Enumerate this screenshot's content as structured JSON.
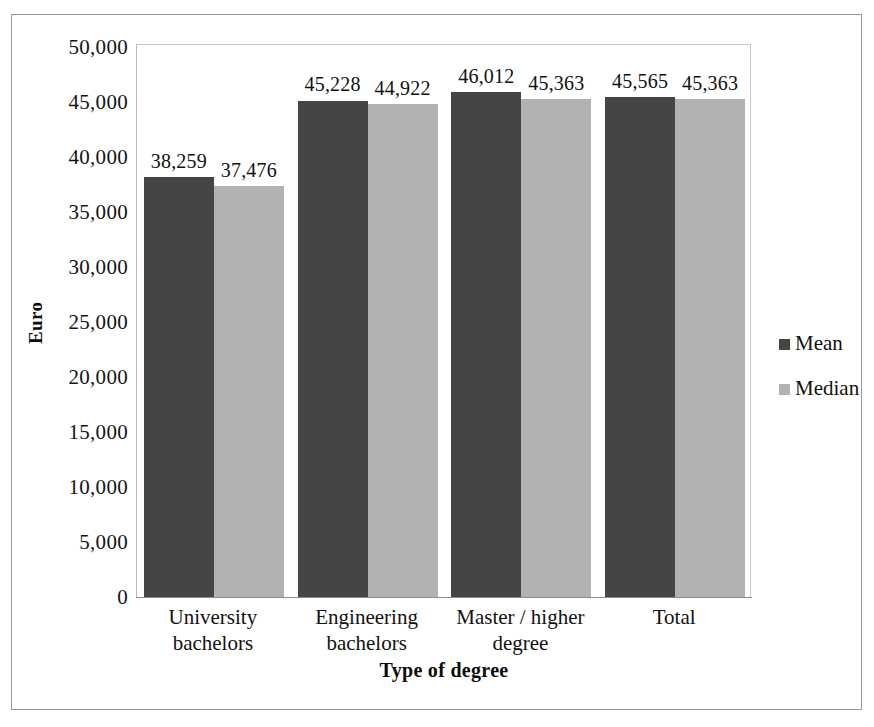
{
  "chart_data": {
    "type": "bar",
    "title": "",
    "xlabel": "Type of degree",
    "ylabel": "Euro",
    "categories": [
      "University bachelors",
      "Engineering bachelors",
      "Master / higher degree",
      "Total"
    ],
    "category_lines": [
      [
        "University",
        "bachelors"
      ],
      [
        "Engineering",
        "bachelors"
      ],
      [
        "Master / higher",
        "degree"
      ],
      [
        "Total",
        ""
      ]
    ],
    "series": [
      {
        "name": "Mean",
        "color": "#454545",
        "values": [
          38259,
          45228,
          46012,
          45565
        ],
        "labels": [
          "38,259",
          "45,228",
          "46,012",
          "45,565"
        ]
      },
      {
        "name": "Median",
        "color": "#b2b2b2",
        "values": [
          37476,
          44922,
          45363,
          45363
        ],
        "labels": [
          "37,476",
          "44,922",
          "45,363",
          "45,363"
        ]
      }
    ],
    "ylim": [
      0,
      50000
    ],
    "ytick_step": 5000,
    "ytick_labels": [
      "50,000",
      "45,000",
      "40,000",
      "35,000",
      "30,000",
      "25,000",
      "20,000",
      "15,000",
      "10,000",
      "5,000",
      "0"
    ],
    "ytick_values": [
      50000,
      45000,
      40000,
      35000,
      30000,
      25000,
      20000,
      15000,
      10000,
      5000,
      0
    ],
    "grid": false,
    "legend_position": "right",
    "legend_entries": [
      {
        "label": "Mean",
        "color": "#454545"
      },
      {
        "label": "Median",
        "color": "#b2b2b2"
      }
    ],
    "plot_border_color": "#b9b9b9",
    "frame_border_color": "#9a9a9a",
    "background_color": "#ffffff"
  }
}
